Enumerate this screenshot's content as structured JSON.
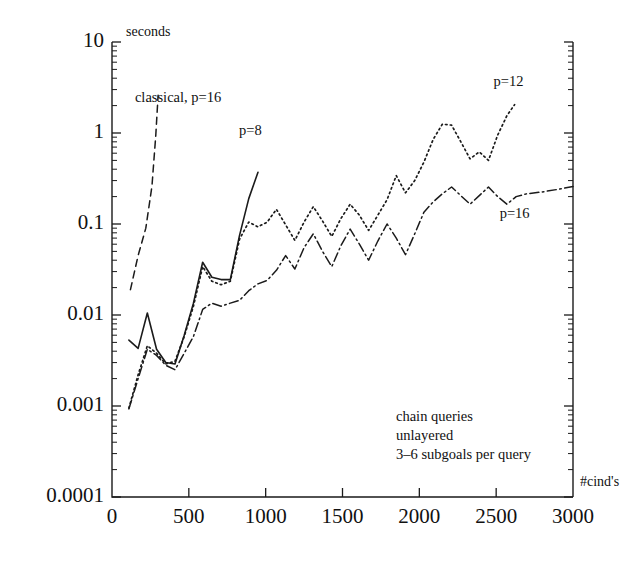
{
  "chart_data": {
    "type": "line",
    "title": "",
    "xlabel": "#cind's",
    "ylabel": "seconds",
    "yscale": "log",
    "xlim": [
      0,
      3000
    ],
    "ylim": [
      0.0001,
      10
    ],
    "grid": false,
    "legend_position": "inline-annotations",
    "x_ticks": [
      "0",
      "500",
      "1000",
      "1500",
      "2000",
      "2500",
      "3000"
    ],
    "x_tick_values": [
      0,
      500,
      1000,
      1500,
      2000,
      2500,
      3000
    ],
    "y_ticks": [
      "10",
      "1",
      "0.1",
      "0.01",
      "0.001",
      "0.0001"
    ],
    "y_tick_values": [
      10,
      1,
      0.1,
      0.01,
      0.001,
      0.0001
    ],
    "annotations": [
      {
        "text": "classical, p=16",
        "x": 430,
        "y": 2.2
      },
      {
        "text": "p=8",
        "x": 900,
        "y": 0.95
      },
      {
        "text": "p=12",
        "x": 2580,
        "y": 3.3
      },
      {
        "text": "p=16",
        "x": 2620,
        "y": 0.115
      }
    ],
    "caption_lines": [
      "chain queries",
      "unlayered",
      "3–6 subgoals per query"
    ],
    "series": [
      {
        "name": "classical, p=16",
        "style": "dashed",
        "x": [
          120,
          170,
          220,
          260,
          285,
          300
        ],
        "values": [
          0.019,
          0.045,
          0.09,
          0.26,
          0.95,
          2.6
        ]
      },
      {
        "name": "p=8",
        "style": "solid",
        "x": [
          110,
          170,
          230,
          290,
          350,
          410,
          470,
          530,
          590,
          650,
          710,
          770,
          830,
          890,
          950
        ],
        "values": [
          0.0053,
          0.0043,
          0.0105,
          0.0042,
          0.003,
          0.0029,
          0.006,
          0.0135,
          0.038,
          0.026,
          0.0245,
          0.0245,
          0.075,
          0.19,
          0.37
        ]
      },
      {
        "name": "p=12",
        "style": "dotted",
        "x": [
          110,
          170,
          230,
          290,
          350,
          410,
          470,
          530,
          590,
          650,
          710,
          770,
          830,
          890,
          950,
          1010,
          1070,
          1130,
          1190,
          1250,
          1310,
          1370,
          1430,
          1490,
          1550,
          1610,
          1670,
          1730,
          1790,
          1850,
          1910,
          1970,
          2030,
          2090,
          2150,
          2210,
          2270,
          2330,
          2390,
          2450,
          2510,
          2570,
          2620
        ],
        "values": [
          0.00095,
          0.0022,
          0.0046,
          0.0038,
          0.0029,
          0.0031,
          0.0058,
          0.0125,
          0.034,
          0.0235,
          0.0215,
          0.0235,
          0.068,
          0.105,
          0.093,
          0.105,
          0.145,
          0.098,
          0.066,
          0.105,
          0.155,
          0.108,
          0.073,
          0.115,
          0.165,
          0.125,
          0.085,
          0.125,
          0.185,
          0.34,
          0.22,
          0.3,
          0.48,
          0.85,
          1.25,
          1.22,
          0.8,
          0.52,
          0.62,
          0.5,
          0.95,
          1.55,
          2.05
        ]
      },
      {
        "name": "p=16",
        "style": "dashdot",
        "x": [
          110,
          170,
          230,
          290,
          350,
          410,
          470,
          530,
          590,
          650,
          710,
          770,
          830,
          890,
          950,
          1010,
          1070,
          1130,
          1190,
          1250,
          1310,
          1370,
          1430,
          1490,
          1550,
          1610,
          1670,
          1730,
          1790,
          1850,
          1910,
          1970,
          2030,
          2090,
          2150,
          2210,
          2270,
          2330,
          2390,
          2450,
          2510,
          2570,
          2630,
          2700,
          2800,
          2900,
          3000
        ],
        "values": [
          0.00093,
          0.002,
          0.0042,
          0.0036,
          0.0028,
          0.0025,
          0.0038,
          0.0058,
          0.0115,
          0.0135,
          0.0125,
          0.0135,
          0.0145,
          0.0185,
          0.022,
          0.024,
          0.031,
          0.045,
          0.032,
          0.055,
          0.078,
          0.05,
          0.034,
          0.058,
          0.088,
          0.06,
          0.04,
          0.065,
          0.1,
          0.07,
          0.046,
          0.078,
          0.135,
          0.175,
          0.215,
          0.255,
          0.205,
          0.165,
          0.205,
          0.255,
          0.2,
          0.165,
          0.2,
          0.215,
          0.225,
          0.24,
          0.258
        ]
      }
    ]
  },
  "axes": {
    "y_title": "seconds",
    "x_title": "#cind's"
  }
}
